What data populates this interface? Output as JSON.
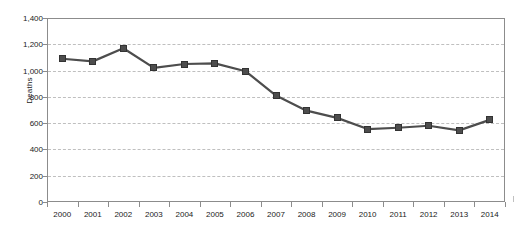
{
  "chart_data": {
    "type": "line",
    "title": "",
    "xlabel": "",
    "ylabel": "Deaths",
    "categories": [
      "2000",
      "2001",
      "2002",
      "2003",
      "2004",
      "2005",
      "2006",
      "2007",
      "2008",
      "2009",
      "2010",
      "2011",
      "2012",
      "2013",
      "2014"
    ],
    "values": [
      1090,
      1070,
      1170,
      1020,
      1050,
      1055,
      995,
      810,
      695,
      640,
      555,
      565,
      580,
      545,
      625
    ],
    "series": [
      {
        "name": "Deaths",
        "values": [
          1090,
          1070,
          1170,
          1020,
          1050,
          1055,
          995,
          810,
          695,
          640,
          555,
          565,
          580,
          545,
          625
        ]
      }
    ],
    "ylim": [
      0,
      1400
    ],
    "ytick_values": [
      0,
      200,
      400,
      600,
      800,
      1000,
      1200,
      1400
    ],
    "ytick_labels": [
      "0",
      "200",
      "400",
      "600",
      "800",
      "1,000",
      "1,200",
      "1,400"
    ],
    "grid": "horizontal-dashed",
    "legend": "none",
    "marker_style": "filled-square",
    "line_color": "#4d4d4d",
    "marker_color": "#4d4d4d",
    "gridline_color": "#bfbfbf",
    "axis_color": "#8c8c8c",
    "annotations": []
  }
}
